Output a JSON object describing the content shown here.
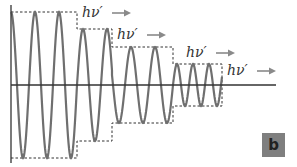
{
  "figure": {
    "panel_label": "b",
    "photon_label": "hν′",
    "colors": {
      "wave": "#6f6f6f",
      "axis": "#333333",
      "envelope": "#333333",
      "arrow": "#8a8a8a",
      "badge_bg": "#7f7f7f",
      "background": "#ffffff"
    },
    "axes": {
      "origin_x": 11,
      "baseline_y": 85,
      "x_end": 276,
      "y_top": 5,
      "y_bottom": 163
    },
    "envelope_steps": [
      {
        "x_start": 11,
        "x_end": 77,
        "amplitude": 73
      },
      {
        "x_start": 77,
        "x_end": 112,
        "amplitude": 56
      },
      {
        "x_start": 112,
        "x_end": 173,
        "amplitude": 38
      },
      {
        "x_start": 173,
        "x_end": 222,
        "amplitude": 21
      }
    ],
    "wave_segments": [
      {
        "x_start": 11,
        "x_end": 77,
        "amplitude": 73,
        "period": 24
      },
      {
        "x_start": 77,
        "x_end": 112,
        "amplitude": 56,
        "period": 24
      },
      {
        "x_start": 112,
        "x_end": 173,
        "amplitude": 38,
        "period": 24
      },
      {
        "x_start": 173,
        "x_end": 222,
        "amplitude": 21,
        "period": 16
      }
    ],
    "photon_emissions": [
      {
        "label": "hν′",
        "x": 82,
        "y": 5
      },
      {
        "label": "hν′",
        "x": 117,
        "y": 27
      },
      {
        "label": "hν′",
        "x": 186,
        "y": 45
      },
      {
        "label": "hν′",
        "x": 227,
        "y": 63
      }
    ]
  }
}
